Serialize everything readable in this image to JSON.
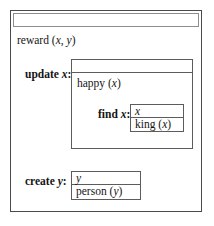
{
  "diagram": {
    "title_bar": {
      "label": ""
    },
    "signature": {
      "name": "reward",
      "args": "(x, y)",
      "full": "reward (x, y)"
    },
    "update_block": {
      "label": "update x:",
      "label_keyword": "update",
      "label_variable": "x",
      "top_strip": "",
      "body_text": "happy (x)",
      "find_block": {
        "label": "find x:",
        "label_keyword": "find",
        "label_variable": "x",
        "rows": [
          {
            "text": "x"
          },
          {
            "text": "king (x)"
          }
        ]
      }
    },
    "create_block": {
      "label": "create y:",
      "label_keyword": "create",
      "label_variable": "y",
      "rows": [
        {
          "text": "y"
        },
        {
          "text": "person (y)"
        }
      ]
    }
  },
  "colors": {
    "outer_border": "#4a4a4a",
    "inner_border": "#5c5c5c",
    "header_border": "#8d8d8d",
    "background": "#ffffff",
    "text": "#141414"
  }
}
